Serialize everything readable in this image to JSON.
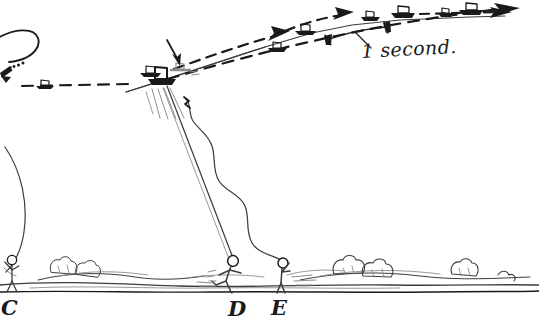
{
  "figure": {
    "background_color": "#ffffff",
    "ink_color": "#1a1a1a",
    "width": 539,
    "height": 324
  },
  "annotations": {
    "duration_label": "1 second.",
    "duration_label_role": "time-interval-measurement"
  },
  "ground_markers": [
    {
      "id": "marker-c",
      "label": "C",
      "x": 2,
      "y": 297
    },
    {
      "id": "marker-d",
      "label": "D",
      "x": 229,
      "y": 298
    },
    {
      "id": "marker-e",
      "label": "E",
      "x": 272,
      "y": 297
    }
  ],
  "figures": [
    {
      "id": "runner",
      "role": "running-stick-figure",
      "near_marker": "D"
    },
    {
      "id": "holder",
      "role": "standing-stick-figure-arm-raised",
      "near_marker": "E"
    },
    {
      "id": "bystander",
      "role": "standing-stick-figure",
      "near_marker": "C"
    }
  ],
  "trajectory": {
    "id": "kite-flight-path",
    "description": "ascending curved path with glider icons and dashed motion arrows",
    "glider_count": 8
  },
  "lines": [
    {
      "id": "taut-kite-line",
      "style": "straight",
      "from": "runner",
      "to": "kite"
    },
    {
      "id": "slack-kite-line",
      "style": "wavy",
      "from": "holder",
      "to": "kite"
    },
    {
      "id": "long-arc-line",
      "style": "arc",
      "from": "bystander",
      "to": "upper-left"
    }
  ]
}
